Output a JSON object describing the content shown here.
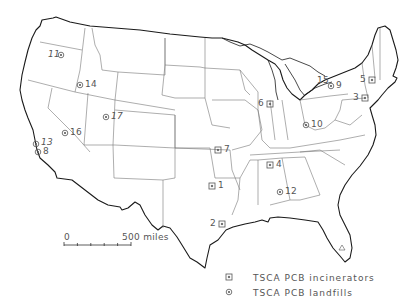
{
  "map": {
    "region": "Contiguous United States",
    "sites": [
      {
        "id": "1",
        "type": "incinerator",
        "x": 212,
        "y": 186,
        "label_side": "right"
      },
      {
        "id": "2",
        "type": "incinerator",
        "x": 222,
        "y": 224,
        "label_side": "left"
      },
      {
        "id": "3",
        "type": "incinerator",
        "x": 365,
        "y": 98,
        "label_side": "left"
      },
      {
        "id": "4",
        "type": "incinerator",
        "x": 270,
        "y": 165,
        "label_side": "right"
      },
      {
        "id": "5",
        "type": "incinerator",
        "x": 372,
        "y": 80,
        "label_side": "left"
      },
      {
        "id": "6",
        "type": "incinerator",
        "x": 270,
        "y": 104,
        "label_side": "left"
      },
      {
        "id": "7",
        "type": "incinerator",
        "x": 218,
        "y": 150,
        "label_side": "right"
      },
      {
        "id": "8",
        "type": "landfill",
        "x": 38,
        "y": 152,
        "label_side": "right"
      },
      {
        "id": "9",
        "type": "landfill",
        "x": 335,
        "y": 84,
        "label_side": "right"
      },
      {
        "id": "10",
        "type": "landfill",
        "x": 306,
        "y": 125,
        "label_side": "right"
      },
      {
        "id": "11",
        "type": "landfill",
        "x": 61,
        "y": 55,
        "label_side": "left"
      },
      {
        "id": "12",
        "type": "landfill",
        "x": 280,
        "y": 192,
        "label_side": "right"
      },
      {
        "id": "13",
        "type": "landfill",
        "x": 36,
        "y": 143,
        "label_side": "right"
      },
      {
        "id": "14",
        "type": "landfill",
        "x": 80,
        "y": 85,
        "label_side": "right"
      },
      {
        "id": "15",
        "type": "landfill",
        "x": 333,
        "y": 84,
        "label_side": "above-left"
      },
      {
        "id": "16",
        "type": "landfill",
        "x": 65,
        "y": 133,
        "label_side": "right"
      },
      {
        "id": "17",
        "type": "landfill",
        "x": 106,
        "y": 117,
        "label_side": "right"
      }
    ]
  },
  "labels": {
    "s1": "1",
    "s2": "2",
    "s3": "3",
    "s4": "4",
    "s5": "5",
    "s6": "6",
    "s7": "7",
    "s8": "8",
    "s9": "9",
    "s10": "10",
    "s11": "11",
    "s12": "12",
    "s13": "13",
    "s14": "14",
    "s15": "15",
    "s16": "16",
    "s17": "17"
  },
  "scale_bar": {
    "min_label": "0",
    "max_label": "500 miles",
    "ticks": 6
  },
  "legend": {
    "items": [
      {
        "symbol": "square-dot",
        "label": "TSCA  PCB  incinerators"
      },
      {
        "symbol": "circle-dot",
        "label": "TSCA  PCB  landfills"
      }
    ]
  },
  "colors": {
    "outline": "#1a1a1a",
    "state_border": "#777777",
    "marker": "#555555",
    "text": "#555555",
    "background": "#ffffff"
  }
}
